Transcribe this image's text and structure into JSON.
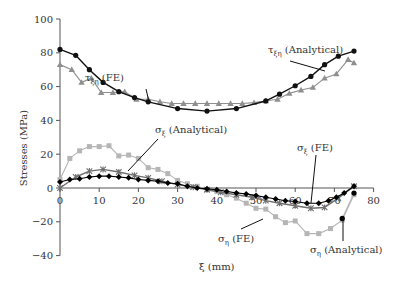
{
  "chart_data": {
    "type": "line",
    "title": "",
    "xlabel": "ξ (mm)",
    "ylabel": "Stresses (MPa)",
    "xlim": [
      0,
      80
    ],
    "ylim": [
      -40,
      100
    ],
    "x_ticks": [
      0,
      10,
      20,
      30,
      40,
      50,
      60,
      70,
      80
    ],
    "y_ticks": [
      -40,
      -20,
      0,
      20,
      40,
      60,
      80,
      100
    ],
    "grid": false,
    "legend": "inline annotations",
    "series": [
      {
        "name": "τξη (Analytical)",
        "marker": "circle",
        "color": "#111111",
        "x": [
          0,
          4,
          7.5,
          11,
          15,
          19,
          22.5,
          30,
          37.5,
          45,
          52.5,
          56,
          60,
          64,
          67.5,
          71,
          75
        ],
        "y": [
          82,
          78.5,
          70,
          62.5,
          57,
          53.5,
          51,
          47,
          45.5,
          47,
          51.5,
          55.5,
          60.5,
          66,
          73,
          78,
          81
        ]
      },
      {
        "name": "τξη (FE)",
        "marker": "triangle",
        "color": "#8f8f8f",
        "x": [
          0,
          3,
          5.5,
          8,
          10.5,
          13.5,
          16.5,
          19.5,
          22.5,
          25.5,
          28.5,
          31.5,
          34.5,
          37.5,
          40.5,
          43.5,
          46.5,
          49.5,
          52.5,
          55.5,
          58.5,
          61.5,
          64.5,
          67.5,
          70.5,
          73.5,
          75
        ],
        "y": [
          73,
          70,
          62.5,
          65,
          56.5,
          56.5,
          57,
          52.5,
          52.5,
          51,
          50,
          50,
          50,
          50,
          50,
          50,
          50,
          50.5,
          51.5,
          52.5,
          56,
          58,
          59.5,
          65,
          67.5,
          76,
          74
        ]
      },
      {
        "name": "σξ (Analytical)",
        "marker": "asterisk",
        "color": "#6e6e6e",
        "x": [
          0,
          4,
          7.5,
          11,
          15,
          19,
          22.5,
          26,
          30,
          34,
          37.5,
          41,
          45,
          49,
          52.5,
          56,
          60,
          64,
          67.5,
          71,
          75
        ],
        "y": [
          0,
          6.5,
          10,
          11,
          9.5,
          7.5,
          6,
          4,
          2,
          0.5,
          -1,
          -2.5,
          -4,
          -5.5,
          -7.5,
          -9,
          -10.5,
          -12,
          -11.5,
          -6,
          1
        ]
      },
      {
        "name": "σξ (FE)",
        "marker": "diamond",
        "color": "#000000",
        "x": [
          0,
          2.5,
          5,
          7.5,
          10,
          12.5,
          15,
          17.5,
          20,
          22.5,
          25,
          27.5,
          30,
          32.5,
          35,
          37.5,
          40,
          42.5,
          45,
          47.5,
          50,
          52.5,
          55,
          57.5,
          60,
          63,
          66,
          68.5,
          70.5,
          72.5,
          75
        ],
        "y": [
          3.5,
          5,
          5.5,
          6.5,
          7,
          7,
          6.5,
          6,
          5,
          4.5,
          4,
          3,
          2.5,
          1,
          0,
          -0.5,
          -1,
          -2,
          -3,
          -3.5,
          -4.5,
          -5.5,
          -6.5,
          -7.5,
          -8,
          -9,
          -9,
          -7.5,
          -5.5,
          -3,
          1
        ]
      },
      {
        "name": "ση (FE)",
        "marker": "square",
        "color": "#b5b5b5",
        "x": [
          0,
          2.5,
          5,
          7.5,
          10,
          12.5,
          15,
          17.5,
          20,
          22.5,
          25,
          27.5,
          30,
          32.5,
          35,
          37.5,
          40,
          42.5,
          45,
          47.5,
          50,
          52.5,
          55,
          57.5,
          60,
          63,
          66,
          69,
          72,
          75
        ],
        "y": [
          5,
          17.5,
          22,
          24.5,
          24.5,
          25,
          19,
          19.5,
          17.5,
          12,
          11,
          8.5,
          4.5,
          2.5,
          1,
          -1,
          -2,
          -4,
          -6,
          -9,
          -12,
          -12.5,
          -17,
          -20.5,
          -19.5,
          -27,
          -27,
          -24,
          -19,
          -4
        ]
      },
      {
        "name": "ση (Analytical)",
        "marker": "circle",
        "color": "#000000",
        "x": [
          72,
          75
        ],
        "y": [
          -18,
          -3
        ]
      }
    ],
    "annotations": [
      {
        "text": "τξη (FE)",
        "points_to": "τξη (FE) at ξ≈28"
      },
      {
        "text": "τξη (Analytical)",
        "points_to": "τξη (Analytical) at ξ≈67"
      },
      {
        "text": "σξ (Analytical)",
        "points_to": "σξ (Analytical) at ξ≈16"
      },
      {
        "text": "σξ (FE)",
        "points_to": "σξ (FE) at ξ≈63"
      },
      {
        "text": "ση (FE)",
        "points_to": "ση (FE) at ξ≈52"
      },
      {
        "text": "ση (Analytical)",
        "points_to": "ση (Analytical) at ξ≈72"
      }
    ]
  },
  "labels": {
    "ylabel": "Stresses (MPa)",
    "xlabel": "ξ (mm)",
    "tau_fe": "τ",
    "tau_fe_sub": "ξη",
    "tau_fe_suffix": " (FE)",
    "tau_an": "τ",
    "tau_an_sub": "ξη",
    "tau_an_suffix": " (Analytical)",
    "sx_an": "σ",
    "sx_an_sub": "ξ",
    "sx_an_suffix": " (Analytical)",
    "sx_fe": "σ",
    "sx_fe_sub": "ξ",
    "sx_fe_suffix": " (FE)",
    "se_fe": "σ",
    "se_fe_sub": "η",
    "se_fe_suffix": " (FE)",
    "se_an": "σ",
    "se_an_sub": "η",
    "se_an_suffix": " (Analytical)"
  }
}
